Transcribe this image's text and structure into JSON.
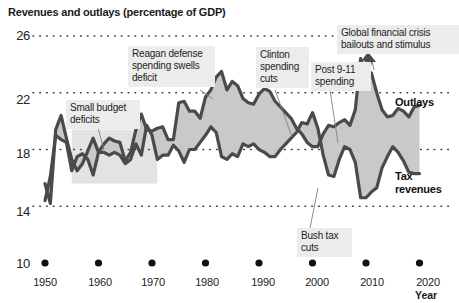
{
  "chart_data": {
    "type": "area",
    "title": "Revenues and outlays (percentage of GDP)",
    "xlabel": "Year",
    "ylabel": "",
    "xlim": [
      1948,
      2022
    ],
    "ylim": [
      10,
      26
    ],
    "grid": true,
    "grid_style": "dotted-horizontal",
    "legend": "inline-series-labels",
    "y_ticks": [
      26,
      22,
      18,
      14,
      10
    ],
    "x_ticks": [
      1950,
      1960,
      1970,
      1980,
      1990,
      2000,
      2010,
      2020
    ],
    "x": [
      1950,
      1951,
      1952,
      1953,
      1954,
      1955,
      1956,
      1957,
      1958,
      1959,
      1960,
      1961,
      1962,
      1963,
      1964,
      1965,
      1966,
      1967,
      1968,
      1969,
      1970,
      1971,
      1972,
      1973,
      1974,
      1975,
      1976,
      1977,
      1978,
      1979,
      1980,
      1981,
      1982,
      1983,
      1984,
      1985,
      1986,
      1987,
      1988,
      1989,
      1990,
      1991,
      1992,
      1993,
      1994,
      1995,
      1996,
      1997,
      1998,
      1999,
      2000,
      2001,
      2002,
      2003,
      2004,
      2005,
      2006,
      2007,
      2008,
      2009,
      2010,
      2011,
      2012,
      2013,
      2014,
      2015,
      2016,
      2017,
      2018,
      2019,
      2020
    ],
    "series": [
      {
        "name": "Outlays",
        "color": "#4a4a4a",
        "values": [
          15.6,
          14.2,
          19.4,
          20.4,
          18.8,
          17.3,
          16.5,
          17.0,
          17.9,
          18.8,
          17.8,
          18.4,
          18.8,
          18.6,
          18.5,
          17.2,
          17.8,
          19.4,
          20.5,
          19.4,
          19.3,
          19.5,
          19.6,
          18.7,
          18.7,
          21.3,
          21.4,
          20.7,
          20.7,
          20.2,
          21.7,
          22.2,
          23.1,
          23.5,
          22.2,
          22.8,
          22.5,
          21.6,
          21.3,
          21.2,
          21.9,
          22.3,
          22.1,
          21.4,
          21.0,
          20.6,
          20.2,
          19.5,
          19.1,
          18.5,
          18.2,
          18.2,
          19.1,
          19.7,
          19.6,
          19.9,
          20.1,
          19.7,
          20.8,
          24.4,
          23.4,
          23.4,
          22.0,
          20.8,
          20.3,
          20.4,
          20.9,
          20.7,
          20.3,
          21.0,
          21.1
        ]
      },
      {
        "name": "Tax revenues",
        "color": "#4a4a4a",
        "values": [
          14.4,
          16.1,
          19.0,
          18.7,
          18.5,
          16.5,
          17.5,
          17.7,
          17.3,
          16.2,
          17.8,
          17.8,
          17.6,
          17.8,
          17.6,
          17.0,
          17.3,
          18.4,
          17.6,
          19.7,
          19.0,
          17.3,
          17.6,
          17.6,
          18.3,
          17.9,
          17.1,
          18.0,
          18.0,
          18.5,
          19.0,
          19.6,
          19.2,
          17.5,
          17.3,
          17.7,
          17.5,
          18.4,
          18.2,
          18.4,
          18.0,
          17.8,
          17.5,
          17.5,
          18.0,
          18.4,
          18.8,
          19.2,
          19.9,
          19.8,
          20.6,
          19.5,
          17.6,
          16.2,
          16.1,
          17.3,
          18.2,
          18.0,
          17.1,
          14.6,
          14.6,
          15.0,
          15.3,
          16.7,
          17.5,
          18.2,
          17.8,
          17.2,
          16.4,
          16.3,
          16.3
        ]
      }
    ],
    "annotations": [
      {
        "id": "small-budget-deficits",
        "text": "Small budget\ndeficits",
        "line1": "Small budget",
        "line2": "deficits",
        "target_year": 1962
      },
      {
        "id": "reagan-defense",
        "text": "Reagan defense\nspending swells\ndeficit",
        "line1": "Reagan defense",
        "line2": "spending swells",
        "line3": "deficit",
        "target_year": 1983
      },
      {
        "id": "clinton-spending-cuts",
        "text": "Clinton\nspending\ncuts",
        "line1": "Clinton",
        "line2": "spending",
        "line3": "cuts",
        "target_year": 1997
      },
      {
        "id": "post-911-spending",
        "text": "Post 9-11\nspending",
        "line1": "Post 9-11",
        "line2": "spending",
        "target_year": 2003
      },
      {
        "id": "global-financial-crisis",
        "text": "Global financial crisis\nbailouts and stimulus",
        "line1": "Global financial crisis",
        "line2": "bailouts and stimulus",
        "target_year": 2009
      },
      {
        "id": "bush-tax-cuts",
        "text": "Bush tax\ncuts",
        "line1": "Bush tax",
        "line2": "cuts",
        "target_year": 2004
      }
    ],
    "series_labels": [
      {
        "id": "outlays-label",
        "line1": "Outlays",
        "line2": ""
      },
      {
        "id": "tax-revenues-label",
        "line1": "Tax",
        "line2": "revenues"
      }
    ],
    "colors": {
      "line": "#4a4a4a",
      "fill": "#c9c9c9",
      "callout_bg": "#ececec",
      "grid": "#3a3a3a",
      "text": "#1a1a1a",
      "band_highlight": "#e3e3e3"
    }
  },
  "yticks": {
    "t0": "26",
    "t1": "22",
    "t2": "18",
    "t3": "14",
    "t4": "10"
  },
  "xticks": {
    "t0": "1950",
    "t1": "1960",
    "t2": "1970",
    "t3": "1980",
    "t4": "1990",
    "t5": "2000",
    "t6": "2010",
    "t7": "2020"
  },
  "axis": {
    "xlabel": "Year"
  },
  "title": {
    "text": "Revenues and outlays (percentage of GDP)"
  },
  "callouts": {
    "small_budget": {
      "l1": "Small budget",
      "l2": "deficits"
    },
    "reagan": {
      "l1": "Reagan defense",
      "l2": "spending swells",
      "l3": "deficit"
    },
    "clinton": {
      "l1": "Clinton",
      "l2": "spending",
      "l3": "cuts"
    },
    "post911": {
      "l1": "Post 9-11",
      "l2": "spending"
    },
    "gfc": {
      "l1": "Global financial crisis",
      "l2": "bailouts and stimulus"
    },
    "bush": {
      "l1": "Bush tax",
      "l2": "cuts"
    }
  },
  "series_labels": {
    "outlays": "Outlays",
    "tax_l1": "Tax",
    "tax_l2": "revenues"
  }
}
